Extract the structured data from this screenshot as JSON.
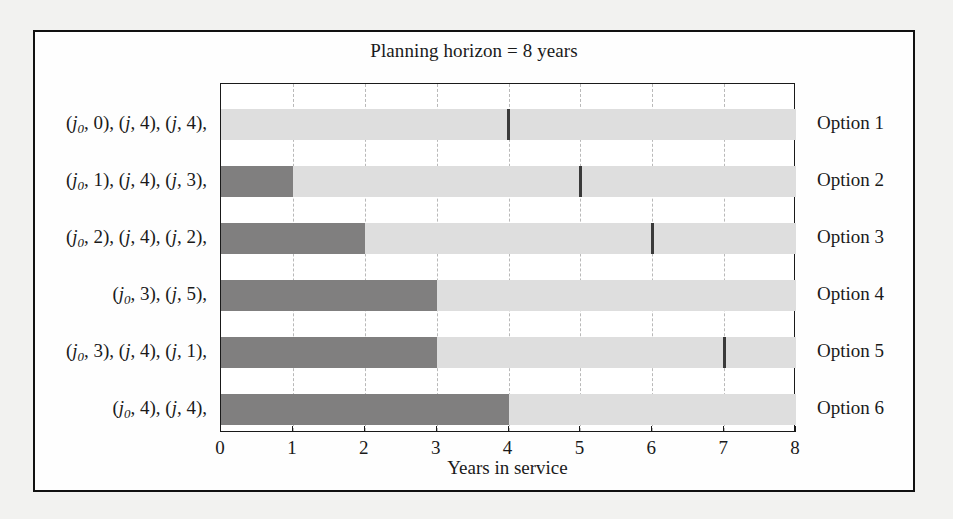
{
  "figure": {
    "title": "Planning horizon = 8 years",
    "xlabel": "Years in service"
  },
  "axis": {
    "ticks": [
      "0",
      "1",
      "2",
      "3",
      "4",
      "5",
      "6",
      "7",
      "8"
    ]
  },
  "colors": {
    "dark_segment": "#807f7f",
    "light_segment": "#dedede",
    "marker": "#3a3a3a",
    "frame": "#111111",
    "gridline": "#b9b9b9",
    "page_background": "#f2f2f0"
  },
  "rows": [
    {
      "option_label": "Option 1",
      "policy_label_parts": [
        {
          "sub": "0",
          "value": "0"
        },
        {
          "sub": "",
          "value": "4"
        },
        {
          "sub": "",
          "value": "4"
        }
      ],
      "policy_label_text": "(j0, 0), (j, 4), (j, 4),",
      "dark_end": 0,
      "marker": 4
    },
    {
      "option_label": "Option 2",
      "policy_label_parts": [
        {
          "sub": "0",
          "value": "1"
        },
        {
          "sub": "",
          "value": "4"
        },
        {
          "sub": "",
          "value": "3"
        }
      ],
      "policy_label_text": "(j0, 1), (j, 4), (j, 3),",
      "dark_end": 1,
      "marker": 5
    },
    {
      "option_label": "Option 3",
      "policy_label_parts": [
        {
          "sub": "0",
          "value": "2"
        },
        {
          "sub": "",
          "value": "4"
        },
        {
          "sub": "",
          "value": "2"
        }
      ],
      "policy_label_text": "(j0, 2), (j, 4), (j, 2),",
      "dark_end": 2,
      "marker": 6
    },
    {
      "option_label": "Option 4",
      "policy_label_parts": [
        {
          "sub": "0",
          "value": "3"
        },
        {
          "sub": "",
          "value": "5"
        }
      ],
      "policy_label_text": "(j0, 3), (j, 5),",
      "dark_end": 3,
      "marker": null
    },
    {
      "option_label": "Option 5",
      "policy_label_parts": [
        {
          "sub": "0",
          "value": "3"
        },
        {
          "sub": "",
          "value": "4"
        },
        {
          "sub": "",
          "value": "1"
        }
      ],
      "policy_label_text": "(j0, 3), (j, 4), (j, 1),",
      "dark_end": 3,
      "marker": 7
    },
    {
      "option_label": "Option 6",
      "policy_label_parts": [
        {
          "sub": "0",
          "value": "4"
        },
        {
          "sub": "",
          "value": "4"
        }
      ],
      "policy_label_text": "(j0, 4), (j, 4),",
      "dark_end": 4,
      "marker": null
    }
  ],
  "chart_data": {
    "type": "bar",
    "title": "Planning horizon = 8 years",
    "xlabel": "Years in service",
    "ylabel": "",
    "orientation": "horizontal",
    "xlim": [
      0,
      8
    ],
    "xticks": [
      0,
      1,
      2,
      3,
      4,
      5,
      6,
      7,
      8
    ],
    "grid": true,
    "legend": "none",
    "categories": [
      "Option 1",
      "Option 2",
      "Option 3",
      "Option 4",
      "Option 5",
      "Option 6"
    ],
    "series": [
      {
        "name": "Existing asset in service (dark grey)",
        "values": [
          0,
          1,
          2,
          3,
          3,
          4
        ]
      },
      {
        "name": "Replacement asset in service (light grey)",
        "values": [
          8,
          7,
          6,
          5,
          5,
          4
        ]
      }
    ],
    "markers": {
      "name": "Subsequent replacement instant (dark tick)",
      "values": [
        4,
        5,
        6,
        null,
        7,
        null
      ]
    },
    "row_labels": [
      "(j0, 0), (j, 4), (j, 4),",
      "(j0, 1), (j, 4), (j, 3),",
      "(j0, 2), (j, 4), (j, 2),",
      "(j0, 3), (j, 5),",
      "(j0, 3), (j, 4), (j, 1),",
      "(j0, 4), (j, 4),"
    ]
  }
}
